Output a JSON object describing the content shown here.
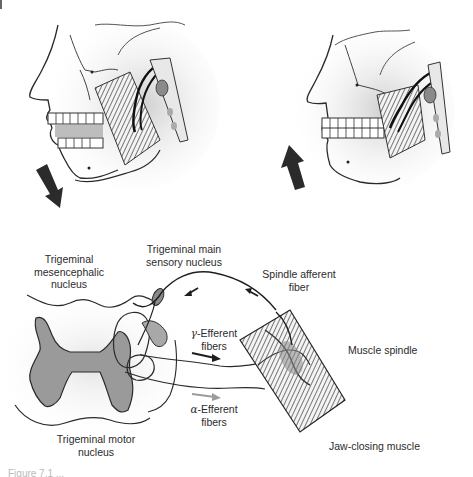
{
  "figure": {
    "panels": [
      {
        "id": "jaw-open",
        "description": "Lateral view of head with mandible depressed (jaw open)",
        "arrow_direction": "down"
      },
      {
        "id": "jaw-closed",
        "description": "Lateral view of head with mandible elevated (jaw closed)",
        "arrow_direction": "up"
      }
    ],
    "labels": {
      "mesencephalic": [
        "Trigeminal",
        "mesencephalic",
        "nucleus"
      ],
      "main_sensory": [
        "Trigeminal main",
        "sensory nucleus"
      ],
      "spindle_afferent": [
        "Spindle afferent",
        "fiber"
      ],
      "gamma_efferent": {
        "symbol": "γ",
        "text": "-Efferent",
        "line2": "fibers"
      },
      "muscle_spindle": "Muscle spindle",
      "alpha_efferent": {
        "symbol": "α",
        "text": "-Efferent",
        "line2": "fibers"
      },
      "motor_nucleus": [
        "Trigeminal motor",
        "nucleus"
      ],
      "jaw_closing": "Jaw-closing muscle"
    },
    "caption_clipped": "Figure 7.1 ..."
  },
  "colors": {
    "ink": "#2a2a2a",
    "shade": "#9a9a9a",
    "alpha_arrow": "#9c9c9c",
    "gamma_arrow": "#1e1e1e"
  }
}
